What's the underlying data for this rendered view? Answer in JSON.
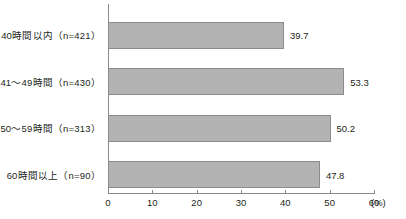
{
  "chart_data": {
    "type": "bar",
    "orientation": "horizontal",
    "title": "",
    "xlabel": "(%)",
    "ylabel": "",
    "categories": [
      "40時間以内（n=421）",
      "41〜49時間（n=430）",
      "50〜59時間（n=313）",
      "60時間以上（n=90）"
    ],
    "values": [
      39.7,
      53.3,
      50.2,
      47.8
    ],
    "value_labels": [
      "39.7",
      "53.3",
      "50.2",
      "47.8"
    ],
    "xlim": [
      0,
      60
    ],
    "xticks": [
      0,
      10,
      20,
      30,
      40,
      50,
      60
    ],
    "xtick_labels": [
      "0",
      "10",
      "20",
      "30",
      "40",
      "50",
      "60"
    ],
    "unit_label": "(%)",
    "grid": false,
    "legend": false,
    "bar_color": "#b3b3b3",
    "bar_border_color": "#8c8c8c",
    "axis_color": "#8a8a8a",
    "text_color": "#231f20"
  }
}
